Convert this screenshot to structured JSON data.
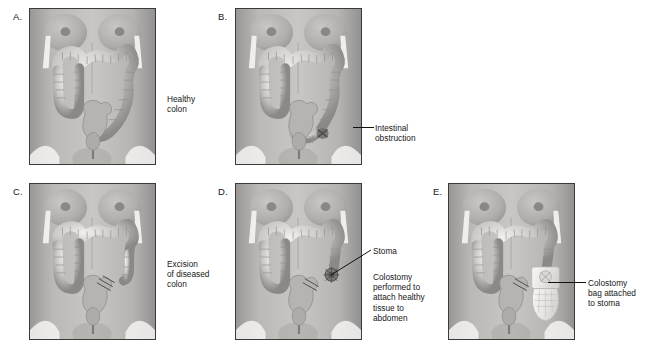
{
  "figure": {
    "background_color": "#ffffff",
    "panel_border_color": "#3a3a3a",
    "text_color": "#161616"
  },
  "panels": [
    {
      "id": "A",
      "label": "A.",
      "caption": "Healthy\ncolon",
      "caption_lines": [
        "Healthy",
        "colon"
      ],
      "has_leader_line": false,
      "callout": null,
      "stage": "healthy-colon",
      "x": 29,
      "y": 8,
      "w": 127,
      "h": 157,
      "label_x": 13,
      "label_y": 11,
      "caption_x": 167,
      "caption_y": 94
    },
    {
      "id": "B",
      "label": "B.",
      "caption": "Intestinal\nobstruction",
      "caption_lines": [
        "Intestinal",
        "obstruction"
      ],
      "has_leader_line": true,
      "callout": "obstruction",
      "stage": "intestinal-obstruction",
      "x": 235,
      "y": 8,
      "w": 127,
      "h": 157,
      "label_x": 218,
      "label_y": 11,
      "caption_x": 375,
      "caption_y": 123
    },
    {
      "id": "C",
      "label": "C.",
      "caption": "Excision\nof diseased\ncolon",
      "caption_lines": [
        "Excision",
        "of diseased",
        "colon"
      ],
      "has_leader_line": false,
      "callout": null,
      "stage": "excision-of-diseased-colon",
      "x": 29,
      "y": 183,
      "w": 127,
      "h": 157,
      "label_x": 13,
      "label_y": 186,
      "caption_x": 167,
      "caption_y": 259
    },
    {
      "id": "D",
      "label": "D.",
      "caption": "Colostomy\nperformed to\nattach healthy\ntissue to\nabdomen",
      "caption_lines": [
        "Colostomy",
        "performed to",
        "attach healthy",
        "tissue to",
        "abdomen"
      ],
      "has_leader_line": true,
      "callout": "Stoma",
      "stage": "colostomy-stoma",
      "x": 235,
      "y": 183,
      "w": 127,
      "h": 157,
      "label_x": 218,
      "label_y": 186,
      "caption_x": 373,
      "caption_y": 272
    },
    {
      "id": "E",
      "label": "E.",
      "caption": "Colostomy\nbag attached\nto stoma",
      "caption_lines": [
        "Colostomy",
        "bag attached",
        "to stoma"
      ],
      "has_leader_line": true,
      "callout": "colostomy-bag",
      "stage": "colostomy-bag-attached",
      "x": 448,
      "y": 183,
      "w": 127,
      "h": 157,
      "label_x": 433,
      "label_y": 186,
      "caption_x": 588,
      "caption_y": 278
    }
  ],
  "callouts": {
    "stoma_label": "Stoma",
    "stoma_label_x": 373,
    "stoma_label_y": 246
  },
  "colors": {
    "skin_light": "#d4d2cf",
    "skin_mid": "#b2b0ad",
    "skin_dark": "#8e8c89",
    "colon_light": "#e8e6e3",
    "colon_mid": "#bdbbb8",
    "colon_shadow": "#8a8885",
    "bag": "#efeeec",
    "leader_line": "#111111"
  }
}
